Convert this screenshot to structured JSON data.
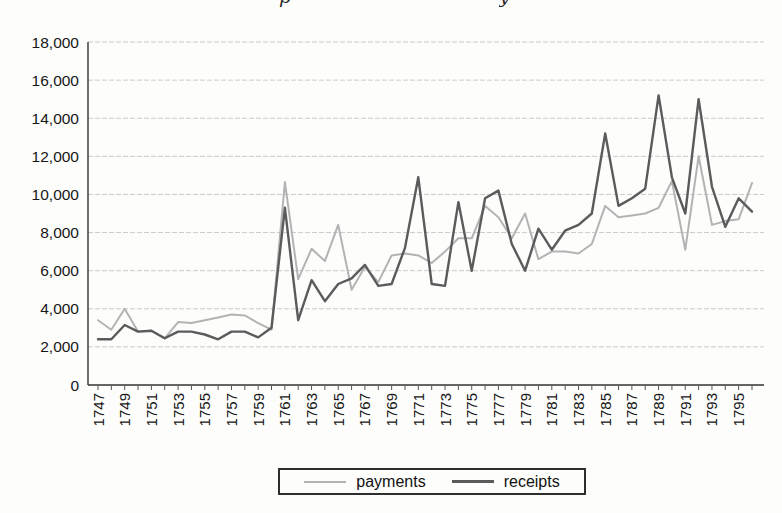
{
  "title_fragments": {
    "left_char": "p",
    "right_char": "y"
  },
  "legend": {
    "items": [
      {
        "label": "payments"
      },
      {
        "label": "receipts"
      }
    ]
  },
  "axis": {
    "line_color": "#333333",
    "grid_color": "#cbcbcb",
    "text_color": "#161616",
    "tick_color": "#555555"
  },
  "chart_data": {
    "type": "line",
    "title": "",
    "xlabel": "",
    "ylabel": "",
    "grid": true,
    "legend_position": "bottom-center",
    "ylim": [
      0,
      18000
    ],
    "ytick_step": 2000,
    "y_tick_labels": [
      "0",
      "2,000",
      "4,000",
      "6,000",
      "8,000",
      "10,000",
      "12,000",
      "14,000",
      "16,000",
      "18,000"
    ],
    "x_tick_labels": [
      "1747",
      "1749",
      "1751",
      "1753",
      "1755",
      "1757",
      "1759",
      "1761",
      "1763",
      "1765",
      "1767",
      "1769",
      "1771",
      "1773",
      "1775",
      "1777",
      "1779",
      "1781",
      "1783",
      "1785",
      "1787",
      "1789",
      "1791",
      "1793",
      "1795"
    ],
    "x": [
      1747,
      1748,
      1749,
      1750,
      1751,
      1752,
      1753,
      1754,
      1755,
      1756,
      1757,
      1758,
      1759,
      1760,
      1761,
      1762,
      1763,
      1764,
      1765,
      1766,
      1767,
      1768,
      1769,
      1770,
      1771,
      1772,
      1773,
      1774,
      1775,
      1776,
      1777,
      1778,
      1779,
      1780,
      1781,
      1782,
      1783,
      1784,
      1785,
      1786,
      1787,
      1788,
      1789,
      1790,
      1791,
      1792,
      1793,
      1794,
      1795,
      1796
    ],
    "series": [
      {
        "name": "payments",
        "color": "#b3b3b3",
        "width": 2,
        "values": [
          3400,
          2900,
          4000,
          2800,
          2850,
          2450,
          3300,
          3250,
          3400,
          3550,
          3700,
          3650,
          3250,
          2900,
          10650,
          5550,
          7150,
          6500,
          8400,
          5000,
          6200,
          5400,
          6800,
          6900,
          6800,
          6400,
          7000,
          7700,
          7700,
          9400,
          8800,
          7700,
          9000,
          6600,
          7000,
          7000,
          6900,
          7400,
          9400,
          8800,
          8900,
          9000,
          9300,
          10700,
          7100,
          12000,
          8400,
          8600,
          8700,
          10600
        ]
      },
      {
        "name": "receipts",
        "color": "#5b5b5b",
        "width": 2.4,
        "values": [
          2400,
          2400,
          3150,
          2800,
          2850,
          2450,
          2800,
          2800,
          2650,
          2400,
          2800,
          2800,
          2500,
          3000,
          9300,
          3400,
          5500,
          4400,
          5300,
          5600,
          6300,
          5200,
          5300,
          7200,
          10900,
          5300,
          5200,
          9600,
          6000,
          9800,
          10200,
          7400,
          6000,
          8200,
          7100,
          8100,
          8400,
          9000,
          13200,
          9400,
          9800,
          10300,
          15200,
          10900,
          9000,
          15000,
          10400,
          8300,
          9800,
          9100
        ]
      }
    ]
  }
}
